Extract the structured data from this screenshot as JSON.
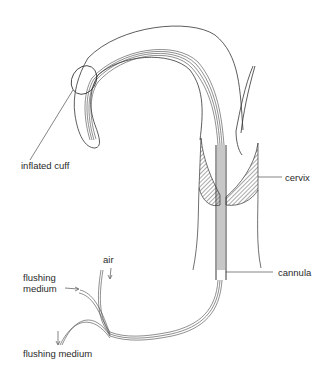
{
  "figure": {
    "type": "anatomical line drawing"
  },
  "labels": {
    "inflated_cuff": "inflated cuff",
    "cervix": "cervix",
    "cannula": "cannula",
    "air": "air",
    "flushing_medium_top_line1": "flushing",
    "flushing_medium_top_line2": "medium",
    "flushing_medium_bottom": "flushing medium"
  },
  "colors": {
    "line": "#333333",
    "hatch": "#555555",
    "background": "#ffffff"
  }
}
